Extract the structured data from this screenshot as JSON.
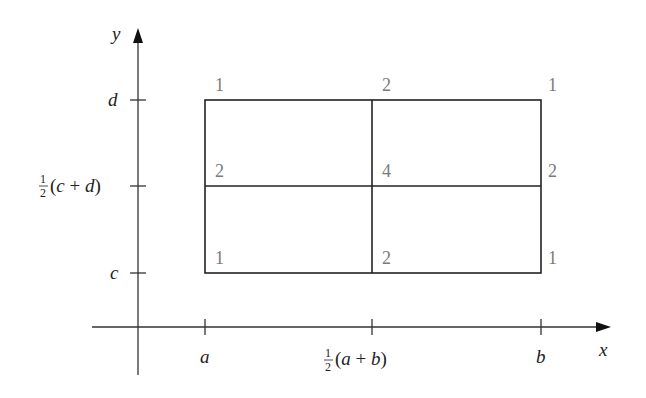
{
  "diagram": {
    "axes": {
      "x_label": "x",
      "y_label": "y",
      "x_ticks": [
        {
          "label": "a"
        },
        {
          "frac_num": "1",
          "frac_den": "2",
          "label": "(a + b)"
        },
        {
          "label": "b"
        }
      ],
      "y_ticks": [
        {
          "label": "d"
        },
        {
          "frac_num": "1",
          "frac_den": "2",
          "label": "(c + d)"
        },
        {
          "label": "c"
        }
      ]
    },
    "weights": {
      "top": [
        "1",
        "2",
        "1"
      ],
      "middle": [
        "2",
        "4",
        "2"
      ],
      "bottom": [
        "1",
        "2",
        "1"
      ]
    },
    "colors": {
      "lines": "#222222",
      "weights": "#7a7a7a"
    }
  }
}
